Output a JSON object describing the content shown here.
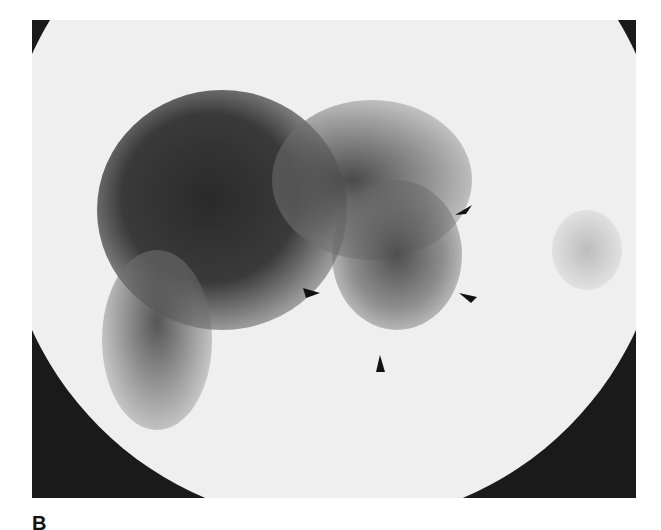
{
  "figure": {
    "panel_label": "B",
    "arrowheads": [
      {
        "id": "upper-right",
        "x": 462,
        "y": 210,
        "points": "lower-left"
      },
      {
        "id": "left",
        "x": 312,
        "y": 293,
        "points": "right"
      },
      {
        "id": "right",
        "x": 467,
        "y": 297,
        "points": "left"
      },
      {
        "id": "bottom",
        "x": 380,
        "y": 363,
        "points": "up"
      }
    ],
    "colors": {
      "background": "#efefef",
      "uptake": "#2e2e2e",
      "frame": "#1a1a1a"
    }
  }
}
